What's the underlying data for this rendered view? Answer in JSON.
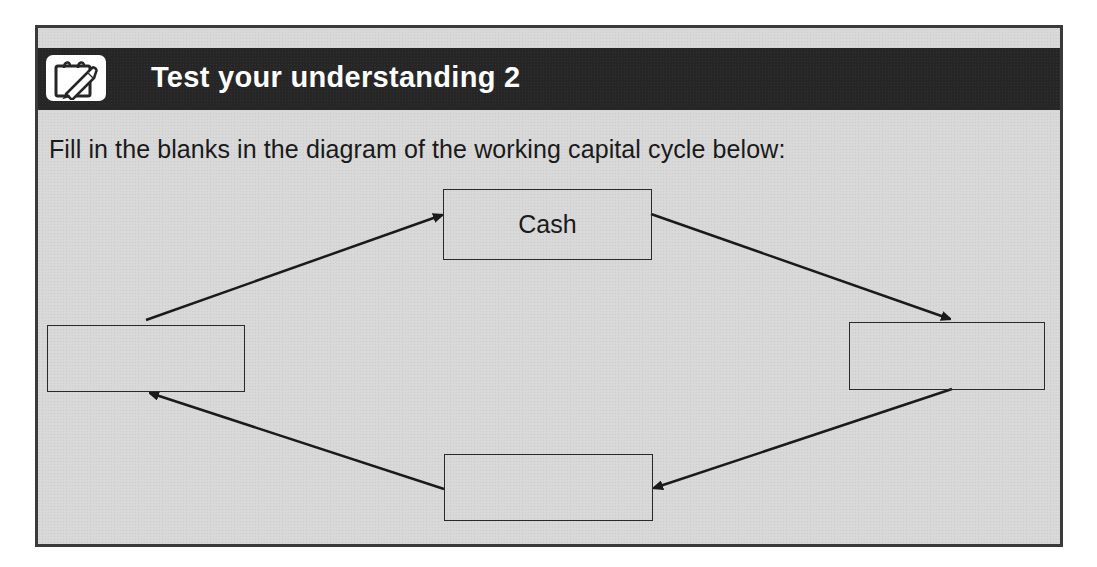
{
  "header": {
    "icon": "notepad-pen-icon",
    "title": "Test your understanding 2"
  },
  "instruction": "Fill in the blanks in the diagram of the working capital cycle below:",
  "diagram": {
    "type": "cycle",
    "boxes": [
      {
        "id": "top",
        "label": "Cash"
      },
      {
        "id": "right",
        "label": ""
      },
      {
        "id": "bottom",
        "label": ""
      },
      {
        "id": "left",
        "label": ""
      }
    ],
    "arrows": [
      {
        "from": "left",
        "to": "top"
      },
      {
        "from": "top",
        "to": "right"
      },
      {
        "from": "right",
        "to": "bottom"
      },
      {
        "from": "bottom",
        "to": "left"
      }
    ]
  },
  "colors": {
    "header_bg": "#262626",
    "panel_bg": "#d8d8d8",
    "border": "#3a3a3a",
    "title_text": "#ffffff"
  }
}
